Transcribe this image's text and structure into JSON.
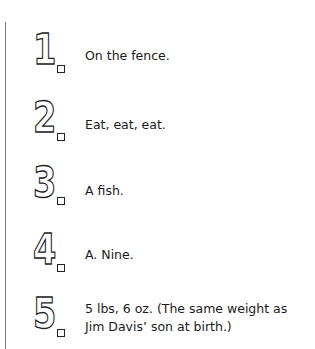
{
  "answers": [
    {
      "number": "1",
      "text": "On the fence."
    },
    {
      "number": "2",
      "text": "Eat, eat, eat."
    },
    {
      "number": "3",
      "text": "A fish."
    },
    {
      "number": "4",
      "text": "A. Nine."
    },
    {
      "number": "5",
      "line1": "5 lbs, 6 oz. (The same weight as",
      "line2": "Jim Davis’ son at birth.)"
    }
  ]
}
